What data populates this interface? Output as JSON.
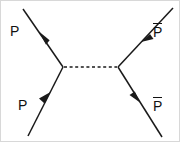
{
  "figure": {
    "kind": "feynman-diagram",
    "width": 180,
    "height": 142,
    "background_color": "#ffffff",
    "border_color": "#d8d8d8",
    "line_color": "#1a1a1a"
  },
  "vertices": {
    "left": {
      "x": 62,
      "y": 66
    },
    "right": {
      "x": 117,
      "y": 66
    }
  },
  "propagator": {
    "style": "dotted",
    "label": "",
    "from": {
      "x": 62,
      "y": 66
    },
    "to": {
      "x": 117,
      "y": 66
    },
    "color": "#1a1a1a"
  },
  "legs": [
    {
      "id": "top-left",
      "label": "P",
      "has_overbar": false,
      "direction": "outgoing",
      "arrow_points": "up-left",
      "from": {
        "x": 62,
        "y": 66
      },
      "to": {
        "x": 22,
        "y": 8
      }
    },
    {
      "id": "bottom-left",
      "label": "P",
      "has_overbar": false,
      "direction": "incoming",
      "arrow_points": "up-right",
      "from": {
        "x": 27,
        "y": 135
      },
      "to": {
        "x": 62,
        "y": 66
      }
    },
    {
      "id": "top-right",
      "label": "P",
      "has_overbar": true,
      "direction": "incoming",
      "arrow_points": "down-left",
      "from": {
        "x": 172,
        "y": 7
      },
      "to": {
        "x": 117,
        "y": 66
      }
    },
    {
      "id": "bottom-right",
      "label": "P",
      "has_overbar": true,
      "direction": "outgoing",
      "arrow_points": "down-right",
      "from": {
        "x": 117,
        "y": 66
      },
      "to": {
        "x": 161,
        "y": 136
      }
    }
  ],
  "labels": {
    "top_left": "P",
    "bottom_left": "P",
    "top_right": "P",
    "bottom_right": "P"
  }
}
